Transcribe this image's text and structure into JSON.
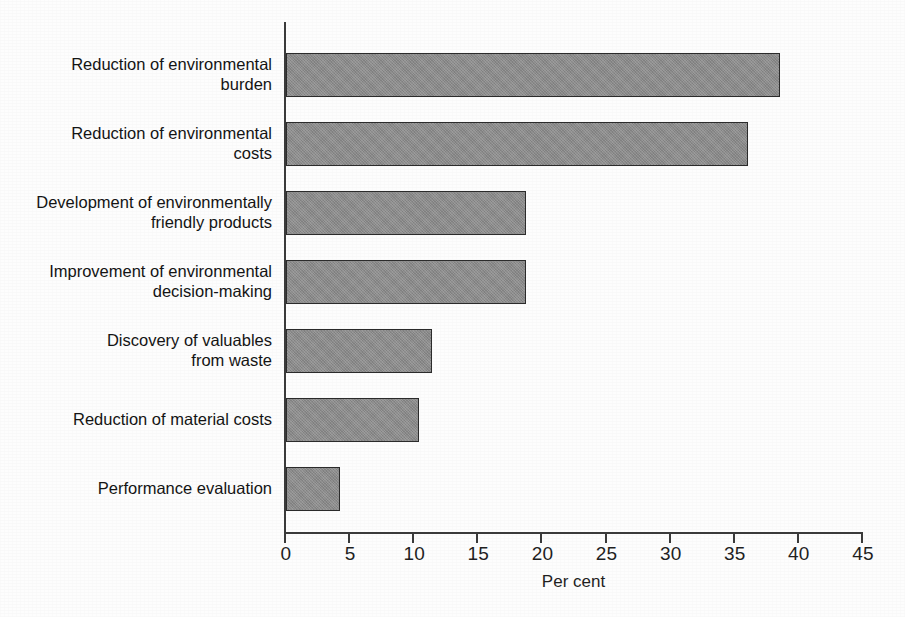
{
  "chart_data": {
    "type": "bar",
    "orientation": "horizontal",
    "title": "",
    "subtitle": "",
    "xlabel": "Per cent",
    "ylabel": "",
    "xlim": [
      0,
      45
    ],
    "xticks": [
      0,
      5,
      10,
      15,
      20,
      25,
      30,
      35,
      40,
      45
    ],
    "xtick_labels": [
      "0",
      "5",
      "10",
      "15",
      "20",
      "25",
      "30",
      "35",
      "40",
      "45"
    ],
    "grid": false,
    "legend": false,
    "bar_color": "#8a8a8a",
    "bar_edge_color": "#2b2b2b",
    "axis_color": "#3a3a3a",
    "background_color": "#fdfdfd",
    "categories": [
      "Reduction of environmental\nburden",
      "Reduction of environmental\ncosts",
      "Development of environmentally\nfriendly products",
      "Improvement of environmental\ndecision-making",
      "Discovery of valuables\nfrom waste",
      "Reduction of material costs",
      "Performance evaluation"
    ],
    "values": [
      38.5,
      36.0,
      18.7,
      18.7,
      11.4,
      10.4,
      4.2
    ],
    "series": [
      {
        "name": "Per cent",
        "values": [
          38.5,
          36.0,
          18.7,
          18.7,
          11.4,
          10.4,
          4.2
        ]
      }
    ],
    "annotations": []
  },
  "axis": {
    "x_title": "Per cent",
    "ticks": [
      "0",
      "5",
      "10",
      "15",
      "20",
      "25",
      "30",
      "35",
      "40",
      "45"
    ]
  },
  "bars": [
    {
      "label": "Reduction of environmental\nburden",
      "value": 38.5
    },
    {
      "label": "Reduction of environmental\ncosts",
      "value": 36.0
    },
    {
      "label": "Development of environmentally\nfriendly products",
      "value": 18.7
    },
    {
      "label": "Improvement of environmental\ndecision-making",
      "value": 18.7
    },
    {
      "label": "Discovery of valuables\nfrom waste",
      "value": 11.4
    },
    {
      "label": "Reduction of material costs",
      "value": 10.4
    },
    {
      "label": "Performance evaluation",
      "value": 4.2
    }
  ]
}
